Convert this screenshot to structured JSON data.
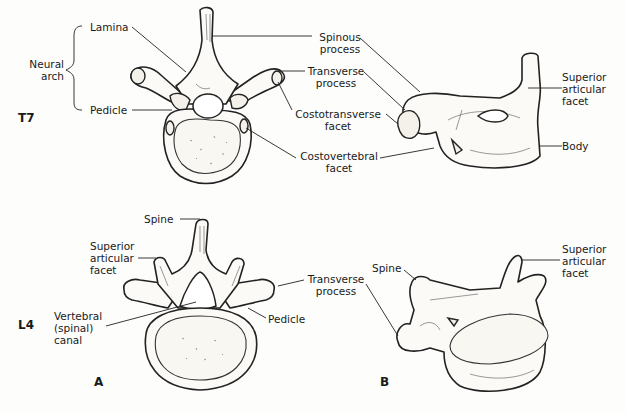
{
  "figure": {
    "panel_labels": {
      "a": "A",
      "b": "B"
    },
    "rows": [
      {
        "level": "T7",
        "group_label": "Neural\narch",
        "view_a_labels": {
          "lamina": "Lamina",
          "pedicle": "Pedicle",
          "spinous_process": "Spinous\nprocess",
          "transverse_process": "Transverse\nprocess",
          "costotransverse_facet": "Costotransverse\nfacet",
          "costovertebral_facet": "Costovertebral\nfacet"
        },
        "view_b_labels": {
          "superior_articular_facet": "Superior\narticular\nfacet",
          "body": "Body"
        }
      },
      {
        "level": "L4",
        "view_a_labels": {
          "spine": "Spine",
          "superior_articular_facet": "Superior\narticular\nfacet",
          "vertebral_canal": "Vertebral\n(spinal)\ncanal",
          "transverse_process": "Transverse\nprocess",
          "pedicle": "Pedicle"
        },
        "view_b_labels": {
          "spine": "Spine",
          "superior_articular_facet": "Superior\narticular\nfacet"
        }
      }
    ]
  }
}
